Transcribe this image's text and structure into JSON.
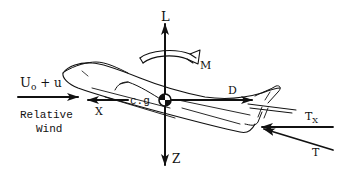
{
  "diagram": {
    "colors": {
      "ink": "#111111",
      "background": "#ffffff"
    },
    "labels": {
      "lift": "L",
      "moment": "M",
      "drag": "D",
      "x_axis": "X",
      "z_axis": "Z",
      "cg": "c.g",
      "velocity_main": "U",
      "velocity_sub": "o",
      "velocity_rest": " + u",
      "relative": "Relative",
      "wind": "Wind",
      "thrust": "T",
      "thrust_x_main": "T",
      "thrust_x_sub": "X"
    }
  }
}
